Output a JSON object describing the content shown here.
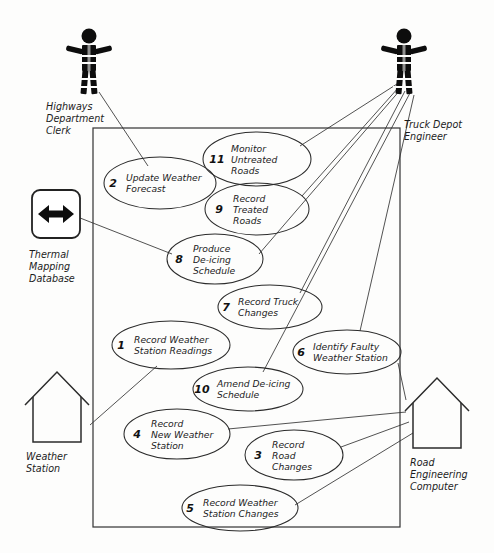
{
  "diagram": {
    "type": "uml-use-case-diagram",
    "title": "",
    "stroke_color": "#2b2b2b",
    "background_color": "#fdfdfc",
    "system_boundary": {
      "x": 93,
      "y": 128,
      "width": 307,
      "height": 399
    }
  },
  "actors": [
    {
      "id": "highways-department-clerk",
      "label": "Highways\nDepartment\nClerk",
      "label_lines": [
        "Highways",
        "Department",
        "Clerk"
      ],
      "icon": "stick-figure-icon",
      "x": 89,
      "y": 30
    },
    {
      "id": "truck-depot-engineer",
      "label": "Truck Depot\nEngineer",
      "label_lines": [
        "Truck Depot",
        "Engineer"
      ],
      "icon": "stick-figure-icon",
      "x": 404,
      "y": 30
    }
  ],
  "system_nodes": [
    {
      "id": "thermal-mapping-database",
      "label_lines": [
        "Thermal",
        "Mapping",
        "Database"
      ],
      "icon": "bidirectional-arrow-icon",
      "shape": "rounded-square",
      "x": 35,
      "y": 190
    },
    {
      "id": "weather-station",
      "label_lines": [
        "Weather",
        "Station"
      ],
      "icon": "house-icon",
      "shape": "house",
      "x": 20,
      "y": 372
    },
    {
      "id": "road-engineering-computer",
      "label_lines": [
        "Road",
        "Engineering",
        "Computer"
      ],
      "icon": "house-icon",
      "shape": "house",
      "x": 408,
      "y": 378
    }
  ],
  "use_cases": [
    {
      "num": "11",
      "lines": [
        "Monitor",
        "Untreated",
        "Roads"
      ],
      "cx": 257,
      "cy": 159,
      "rx": 54,
      "ry": 27,
      "num_dx": -40,
      "text_dx": -26
    },
    {
      "num": "2",
      "lines": [
        "Update Weather",
        "Forecast"
      ],
      "cx": 160,
      "cy": 183,
      "rx": 56,
      "ry": 26,
      "num_dx": -47,
      "text_dx": -34
    },
    {
      "num": "9",
      "lines": [
        "Record",
        "Treated",
        "Roads"
      ],
      "cx": 257,
      "cy": 209,
      "rx": 52,
      "ry": 26,
      "num_dx": -38,
      "text_dx": -24
    },
    {
      "num": "8",
      "lines": [
        "Produce",
        "De-icing",
        "Schedule"
      ],
      "cx": 215,
      "cy": 259,
      "rx": 48,
      "ry": 25,
      "num_dx": -36,
      "text_dx": -22
    },
    {
      "num": "7",
      "lines": [
        "Record Truck",
        "Changes"
      ],
      "cx": 270,
      "cy": 307,
      "rx": 52,
      "ry": 22,
      "num_dx": -44,
      "text_dx": -32
    },
    {
      "num": "1",
      "lines": [
        "Record Weather",
        "Station Readings"
      ],
      "cx": 171,
      "cy": 345,
      "rx": 59,
      "ry": 24,
      "num_dx": -50,
      "text_dx": -37
    },
    {
      "num": "6",
      "lines": [
        "Identify Faulty",
        "Weather Station"
      ],
      "cx": 347,
      "cy": 352,
      "rx": 54,
      "ry": 22,
      "num_dx": -46,
      "text_dx": -34
    },
    {
      "num": "10",
      "lines": [
        "Amend De-icing",
        "Schedule"
      ],
      "cx": 248,
      "cy": 389,
      "rx": 55,
      "ry": 22,
      "num_dx": -46,
      "text_dx": -31
    },
    {
      "num": "4",
      "lines": [
        "Record",
        "New Weather",
        "Station"
      ],
      "cx": 177,
      "cy": 434,
      "rx": 53,
      "ry": 25,
      "num_dx": -40,
      "text_dx": -26
    },
    {
      "num": "3",
      "lines": [
        "Record",
        "Road",
        "Changes"
      ],
      "cx": 294,
      "cy": 455,
      "rx": 49,
      "ry": 25,
      "num_dx": -36,
      "text_dx": -22
    },
    {
      "num": "5",
      "lines": [
        "Record Weather",
        "Station Changes"
      ],
      "cx": 240,
      "cy": 508,
      "rx": 58,
      "ry": 23,
      "num_dx": -50,
      "text_dx": -37
    }
  ],
  "associations": [
    {
      "from": "highways-department-clerk",
      "to": "2",
      "x1": 98,
      "y1": 93,
      "x2": 146,
      "y2": 163
    },
    {
      "from": "thermal-mapping-database",
      "to": "8",
      "x1": 75,
      "y1": 215,
      "x2": 170,
      "y2": 255
    },
    {
      "from": "truck-depot-engineer",
      "to": "11",
      "x1": 396,
      "y1": 85,
      "x2": 298,
      "y2": 144
    },
    {
      "from": "truck-depot-engineer",
      "to": "9",
      "x1": 398,
      "y1": 88,
      "x2": 300,
      "y2": 196
    },
    {
      "from": "truck-depot-engineer",
      "to": "8",
      "x1": 400,
      "y1": 90,
      "x2": 260,
      "y2": 253
    },
    {
      "from": "truck-depot-engineer",
      "to": "7",
      "x1": 404,
      "y1": 92,
      "x2": 300,
      "y2": 294
    },
    {
      "from": "truck-depot-engineer",
      "to": "10",
      "x1": 408,
      "y1": 94,
      "x2": 270,
      "y2": 370
    },
    {
      "from": "truck-depot-engineer",
      "to": "6",
      "x1": 412,
      "y1": 96,
      "x2": 360,
      "y2": 330
    },
    {
      "from": "weather-station",
      "to": "1",
      "x1": 89,
      "y1": 424,
      "x2": 155,
      "y2": 367
    },
    {
      "from": "road-engineering-computer",
      "to": "4",
      "x1": 405,
      "y1": 411,
      "x2": 228,
      "y2": 428
    },
    {
      "from": "road-engineering-computer",
      "to": "6",
      "x1": 404,
      "y1": 400,
      "x2": 396,
      "y2": 362
    },
    {
      "from": "road-engineering-computer",
      "to": "3",
      "x1": 406,
      "y1": 422,
      "x2": 342,
      "y2": 446
    },
    {
      "from": "road-engineering-computer",
      "to": "5",
      "x1": 410,
      "y1": 432,
      "x2": 296,
      "y2": 505
    }
  ]
}
